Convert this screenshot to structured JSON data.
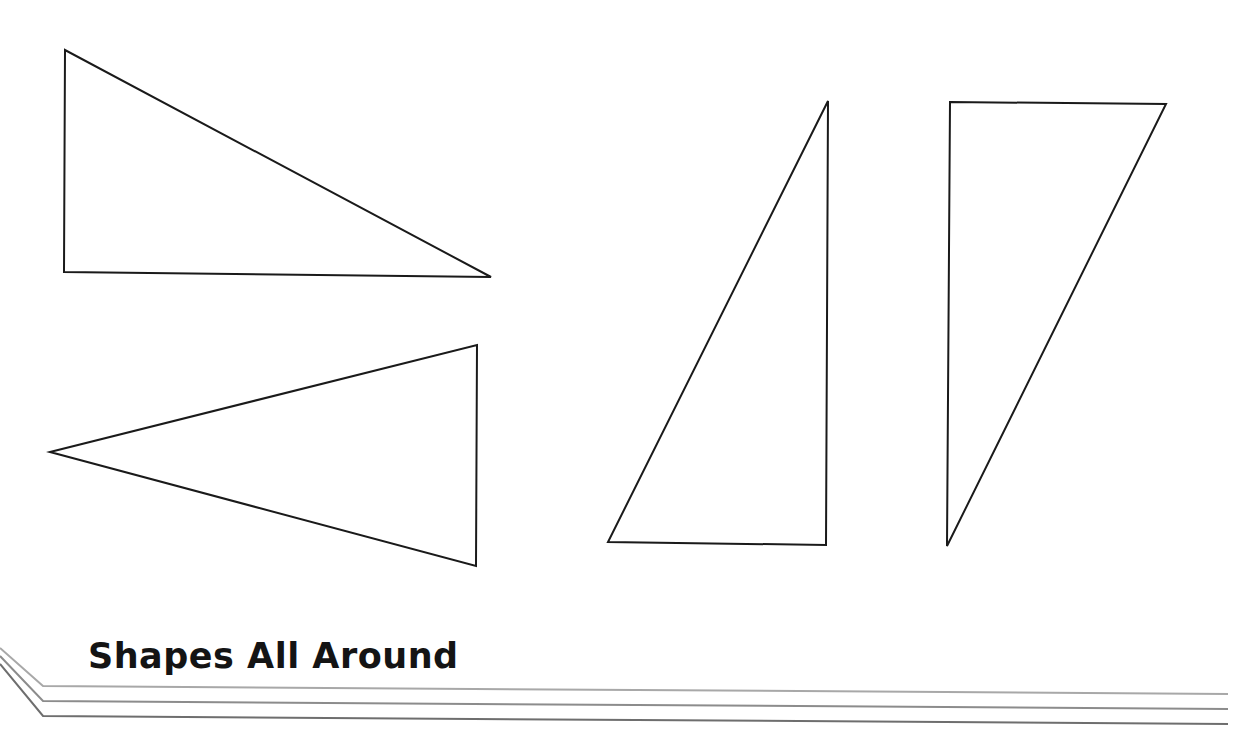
{
  "footer": {
    "title": "Shapes All Around"
  },
  "colors": {
    "stroke": "#1a1a1a",
    "rule_light": "#a8a8a8",
    "rule_mid": "#8c8c8c",
    "rule_dark": "#6e6e6e",
    "background": "#ffffff"
  },
  "shapes": [
    {
      "name": "right-triangle-top-left",
      "points": [
        [
          65,
          50
        ],
        [
          64,
          272
        ],
        [
          491,
          277
        ]
      ]
    },
    {
      "name": "isosceles-triangle-left-pointing",
      "points": [
        [
          50,
          452
        ],
        [
          477,
          345
        ],
        [
          476,
          566
        ]
      ]
    },
    {
      "name": "right-triangle-tall-right-angle-bottom-right",
      "points": [
        [
          828,
          101
        ],
        [
          608,
          542
        ],
        [
          826,
          545
        ]
      ]
    },
    {
      "name": "right-triangle-tall-right-angle-top-left",
      "points": [
        [
          950,
          102
        ],
        [
          1166,
          104
        ],
        [
          947,
          546
        ]
      ]
    }
  ]
}
